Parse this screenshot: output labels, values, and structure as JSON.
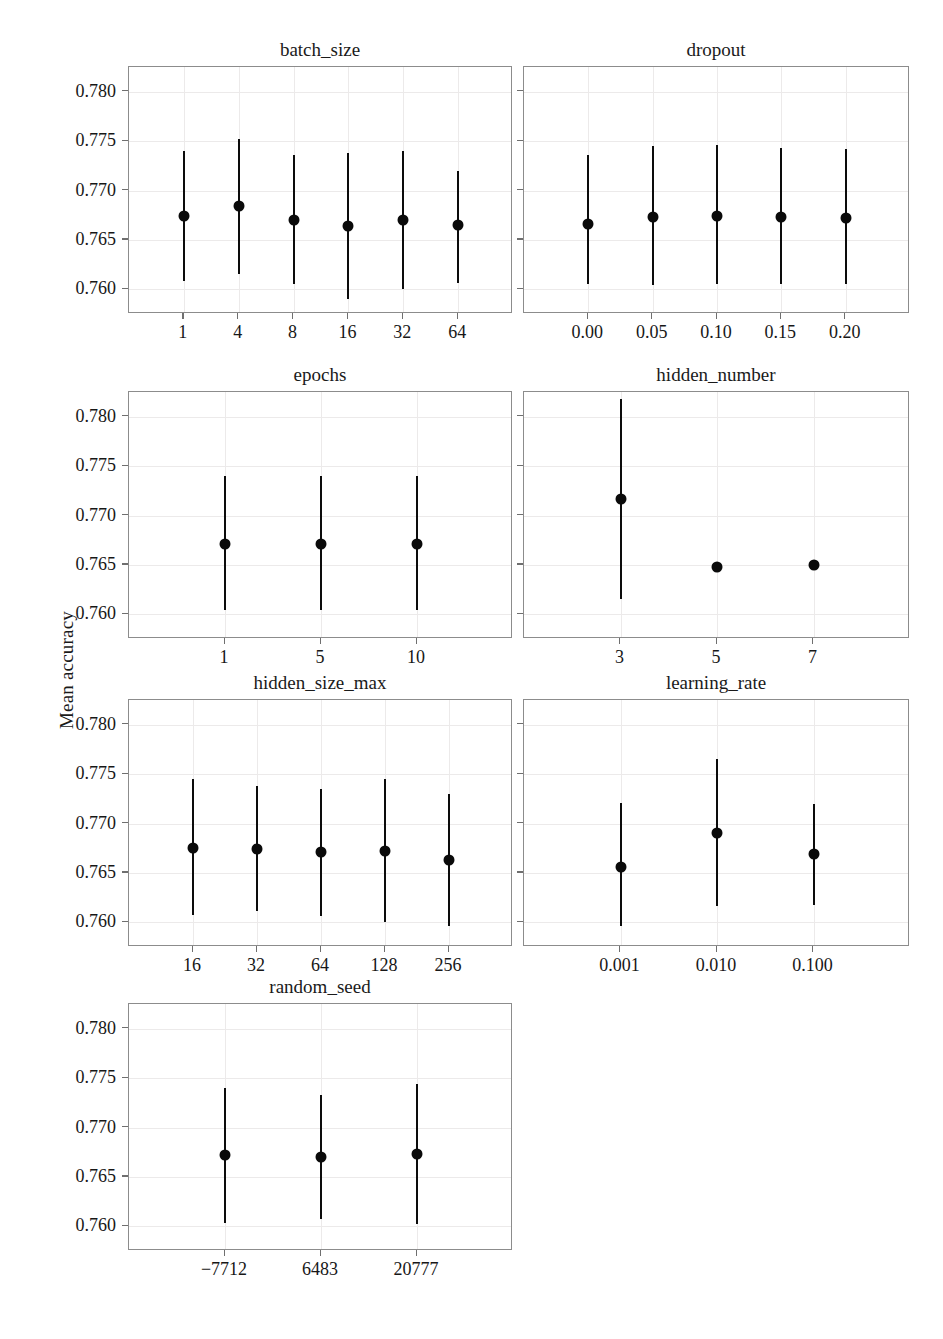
{
  "figure": {
    "ylabel": "Mean accuracy",
    "width": 943,
    "height": 1339,
    "point_color": "#0a0a0a",
    "bar_color": "#0c0c0c",
    "frame_color": "#8c8c8c",
    "grid_color": "#eceaea"
  },
  "chart_data": {
    "type": "scatter",
    "title": "",
    "xlabel": "",
    "ylabel": "Mean accuracy",
    "ylim": [
      0.7575,
      0.7825
    ],
    "yticks": [
      0.76,
      0.765,
      0.77,
      0.775,
      0.78
    ],
    "ytick_labels": [
      "0.760",
      "0.765",
      "0.770",
      "0.775",
      "0.780"
    ],
    "grid": true,
    "legend": "none",
    "marker": "filled-circle",
    "error_style": "vertical-line",
    "panels": [
      {
        "title": "batch_size",
        "row": 0,
        "col": 0,
        "categories": [
          "1",
          "4",
          "8",
          "16",
          "32",
          "64"
        ],
        "values": [
          0.7674,
          0.7684,
          0.767,
          0.7664,
          0.767,
          0.7665
        ],
        "err_low": [
          0.7608,
          0.7615,
          0.7605,
          0.759,
          0.76,
          0.7606
        ],
        "err_high": [
          0.774,
          0.7752,
          0.7736,
          0.7738,
          0.774,
          0.772
        ]
      },
      {
        "title": "dropout",
        "row": 0,
        "col": 1,
        "categories": [
          "0.00",
          "0.05",
          "0.10",
          "0.15",
          "0.20"
        ],
        "values": [
          0.7666,
          0.7673,
          0.7674,
          0.7673,
          0.7672
        ],
        "err_low": [
          0.7605,
          0.7604,
          0.7605,
          0.7605,
          0.7605
        ],
        "err_high": [
          0.7736,
          0.7745,
          0.7746,
          0.7743,
          0.7742
        ]
      },
      {
        "title": "epochs",
        "row": 1,
        "col": 0,
        "categories": [
          "1",
          "5",
          "10"
        ],
        "values": [
          0.7671,
          0.7671,
          0.7671
        ],
        "err_low": [
          0.7604,
          0.7604,
          0.7604
        ],
        "err_high": [
          0.774,
          0.774,
          0.774
        ]
      },
      {
        "title": "hidden_number",
        "row": 1,
        "col": 1,
        "categories": [
          "3",
          "5",
          "7"
        ],
        "values": [
          0.7717,
          0.7648,
          0.765
        ],
        "err_low": [
          0.7615,
          0.7645,
          0.765
        ],
        "err_high": [
          0.7818,
          0.7652,
          0.765
        ]
      },
      {
        "title": "hidden_size_max",
        "row": 2,
        "col": 0,
        "categories": [
          "16",
          "32",
          "64",
          "128",
          "256"
        ],
        "values": [
          0.7675,
          0.7674,
          0.7671,
          0.7672,
          0.7663
        ],
        "err_low": [
          0.7607,
          0.7611,
          0.7606,
          0.76,
          0.7596
        ],
        "err_high": [
          0.7745,
          0.7738,
          0.7735,
          0.7745,
          0.773
        ]
      },
      {
        "title": "learning_rate",
        "row": 2,
        "col": 1,
        "categories": [
          "0.001",
          "0.010",
          "0.100"
        ],
        "values": [
          0.7656,
          0.769,
          0.7669
        ],
        "err_low": [
          0.7596,
          0.7616,
          0.7618
        ],
        "err_high": [
          0.7721,
          0.7765,
          0.772
        ]
      },
      {
        "title": "random_seed",
        "row": 3,
        "col": 0,
        "categories": [
          "−7712",
          "6483",
          "20777"
        ],
        "values": [
          0.7672,
          0.767,
          0.7673
        ],
        "err_low": [
          0.7603,
          0.7607,
          0.7602
        ],
        "err_high": [
          0.774,
          0.7733,
          0.7744
        ]
      }
    ]
  }
}
